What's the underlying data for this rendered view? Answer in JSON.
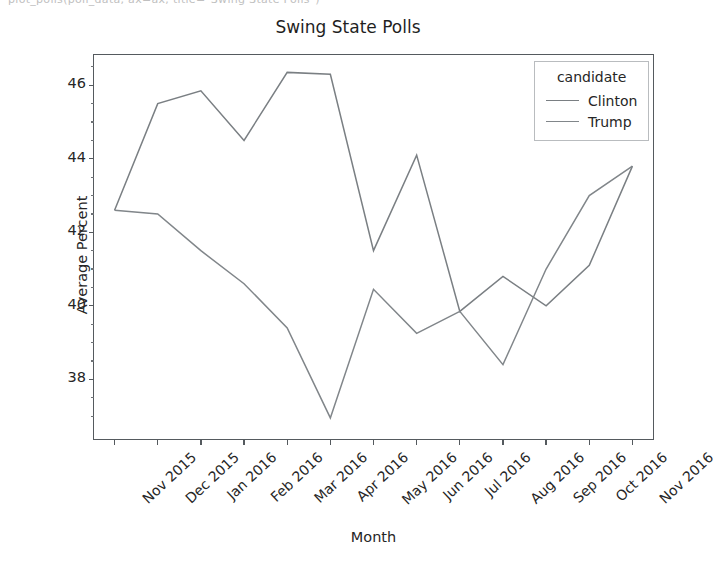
{
  "top_strip": {
    "clipped_text": "plot_polls(poll_data, ax=ax, title=\"Swing State Polls\")"
  },
  "chart_data": {
    "type": "line",
    "title": "Swing State Polls",
    "xlabel": "Month",
    "ylabel": "Average Percent",
    "categories": [
      "Nov 2015",
      "Dec 2015",
      "Jan 2016",
      "Feb 2016",
      "Mar 2016",
      "Apr 2016",
      "May 2016",
      "Jun 2016",
      "Jul 2016",
      "Aug 2016",
      "Sep 2016",
      "Oct 2016",
      "Nov 2016"
    ],
    "series": [
      {
        "name": "Clinton",
        "color": "#7a7f83",
        "values": [
          42.6,
          45.5,
          45.85,
          44.5,
          46.35,
          46.3,
          41.5,
          44.1,
          39.85,
          40.8,
          40.0,
          41.1,
          43.8
        ]
      },
      {
        "name": "Trump",
        "color": "#81868a",
        "values": [
          42.6,
          42.5,
          41.5,
          40.6,
          39.4,
          36.95,
          40.45,
          39.25,
          39.85,
          38.4,
          41.0,
          43.0,
          43.8
        ]
      }
    ],
    "legend_title": "candidate",
    "legend_position": "upper right",
    "ylim": [
      36.35,
      46.85
    ],
    "yticks": [
      38,
      40,
      42,
      44,
      46
    ],
    "ytick_labels": [
      "38",
      "40",
      "42",
      "44",
      "46"
    ],
    "grid": false,
    "xtick_rotation": -43
  }
}
